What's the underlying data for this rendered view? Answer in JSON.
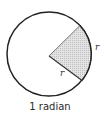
{
  "diagram": {
    "title": "1 radian",
    "caption": "1 radian",
    "labels": {
      "radius_label": "r",
      "arc_label": "r"
    },
    "circle": {
      "cx": 49,
      "cy": 54,
      "r": 42,
      "stroke": "#222222",
      "stroke_width": 1.5,
      "fill": "#ffffff"
    },
    "sector": {
      "apex": [
        49,
        56
      ],
      "start_point": [
        80,
        26
      ],
      "end_point": [
        82,
        81
      ],
      "fill": "#d9d9d9",
      "stroke": "#333333",
      "description": "Shaded sector whose arc length equals the radius r"
    },
    "colors": {
      "line": "#222222",
      "shade": "#d9d9d9",
      "text": "#2a2a2a"
    }
  }
}
